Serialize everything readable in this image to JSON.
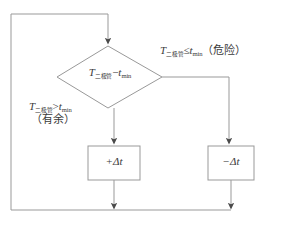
{
  "diagram": {
    "stroke_color": "#999999",
    "text_color": "#3a3a3a",
    "background_color": "#ffffff",
    "decision": {
      "name": "diode-temperature-margin-test",
      "symbol": "T",
      "symbol_subscript": "二极管",
      "operator": "−",
      "operand": "t",
      "operand_subscript": "min"
    },
    "branch_right": {
      "symbol": "T",
      "symbol_subscript": "二极管",
      "operator": "≤",
      "operand": "t",
      "operand_subscript": "min",
      "annotation": "（危险）"
    },
    "branch_left": {
      "symbol": "T",
      "symbol_subscript": "二极管",
      "operator": ">",
      "operand": "t",
      "operand_subscript": "min",
      "annotation": "（有余）"
    },
    "box_left": {
      "name": "increase-delta-t",
      "text": "+Δt"
    },
    "box_right": {
      "name": "decrease-delta-t",
      "text": "−Δt"
    }
  }
}
